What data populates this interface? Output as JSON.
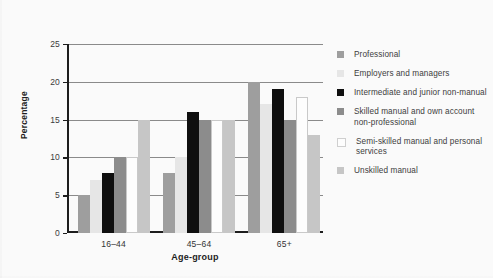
{
  "chart_data": {
    "type": "bar",
    "title": "",
    "subtitle": "",
    "xlabel": "Age-group",
    "ylabel": "Percentage",
    "categories": [
      "16–44",
      "45–64",
      "65+"
    ],
    "ylim": [
      0,
      25
    ],
    "yticks": [
      0,
      5,
      10,
      15,
      20,
      25
    ],
    "ytick_labels": [
      "0",
      "5",
      "10",
      "15",
      "20",
      "25"
    ],
    "grid": true,
    "grid_axis": "y",
    "legend_position": "right",
    "series": [
      {
        "name": "Professional",
        "color": "#9e9e9e",
        "values": [
          5,
          8,
          20
        ]
      },
      {
        "name": "Employers and managers",
        "color": "#e6e6e6",
        "values": [
          7,
          10,
          17
        ]
      },
      {
        "name": "Intermediate and junior non-manual",
        "color": "#0f0f0f",
        "values": [
          8,
          16,
          19
        ]
      },
      {
        "name": "Skilled manual and own account non-professional",
        "color": "#8c8c8c",
        "values": [
          10,
          15,
          15
        ]
      },
      {
        "name": "Semi-skilled manual and personal services",
        "color": "#fdfdfd",
        "values": [
          10,
          15,
          18
        ]
      },
      {
        "name": "Unskilled manual",
        "color": "#c6c6c6",
        "values": [
          15,
          15,
          13
        ]
      }
    ]
  },
  "legend": {
    "entries": [
      {
        "label": "Professional",
        "color": "#9e9e9e"
      },
      {
        "label": "Employers and managers",
        "color": "#e6e6e6"
      },
      {
        "label": "Intermediate and junior non-manual",
        "color": "#0f0f0f"
      },
      {
        "label": "Skilled manual and own account non-professional",
        "color": "#8c8c8c"
      },
      {
        "label": "Semi-skilled manual and personal services",
        "color": "#fdfdfd"
      },
      {
        "label": "Unskilled manual",
        "color": "#c6c6c6"
      }
    ]
  },
  "colors": {
    "axis": "#1d1d1d",
    "gridline": "#8a8a8a",
    "text": "#3a3a3a",
    "background": "#fbfbfb"
  }
}
